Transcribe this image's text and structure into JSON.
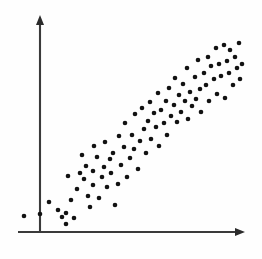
{
  "figure": {
    "title": "",
    "caption": "",
    "background_color": "#fefefe",
    "width": 262,
    "height": 259
  },
  "axes": {
    "x_axis_name": "horizontal-axis",
    "y_axis_name": "vertical-axis",
    "axis_color": "#3a3a3a",
    "arrow_color": "#2b2b2b",
    "origin_x": 40,
    "origin_y": 232,
    "x_axis_start_x": 18,
    "x_axis_end_x": 243,
    "y_axis_top_y": 18,
    "has_arrowheads": true,
    "has_tick_labels": false,
    "has_gridlines": false,
    "x_label": "",
    "y_label": ""
  },
  "marker": {
    "name": "data-point",
    "color": "#121212",
    "radius": 2.3,
    "shape": "circle"
  },
  "chart_data": {
    "type": "scatter",
    "title": "",
    "subtitle": "",
    "xlabel": "",
    "ylabel": "",
    "xlim": [
      0,
      100
    ],
    "ylim": [
      0,
      100
    ],
    "grid": false,
    "legend": null,
    "legend_position": "none",
    "annotations": [],
    "axis_style": "arrowed-axes-no-ticks",
    "correlation": "strong positive linear",
    "n_points": 95,
    "series": [
      {
        "name": "observations",
        "color": "#121212",
        "points": [
          [
            -7.8,
            7.5
          ],
          [
            0.0,
            8.4
          ],
          [
            5.3,
            14.2
          ],
          [
            9.7,
            10.0
          ],
          [
            11.5,
            6.8
          ],
          [
            13.3,
            3.2
          ],
          [
            13.7,
            12.0
          ],
          [
            14.6,
            29.8
          ],
          [
            15.9,
            17.3
          ],
          [
            17.2,
            8.0
          ],
          [
            18.6,
            22.5
          ],
          [
            19.9,
            30.6
          ],
          [
            20.8,
            39.6
          ],
          [
            22.1,
            27.8
          ],
          [
            23.0,
            34.0
          ],
          [
            23.9,
            19.0
          ],
          [
            24.8,
            13.5
          ],
          [
            26.1,
            31.0
          ],
          [
            26.5,
            24.0
          ],
          [
            27.0,
            43.5
          ],
          [
            28.3,
            38.0
          ],
          [
            29.2,
            18.2
          ],
          [
            30.5,
            28.5
          ],
          [
            31.9,
            33.5
          ],
          [
            32.3,
            46.0
          ],
          [
            33.2,
            23.6
          ],
          [
            34.5,
            37.2
          ],
          [
            35.4,
            30.2
          ],
          [
            36.3,
            40.5
          ],
          [
            37.2,
            15.0
          ],
          [
            38.5,
            25.5
          ],
          [
            39.4,
            49.5
          ],
          [
            40.3,
            35.0
          ],
          [
            41.6,
            44.0
          ],
          [
            42.0,
            56.0
          ],
          [
            43.4,
            29.0
          ],
          [
            44.7,
            38.5
          ],
          [
            45.6,
            50.0
          ],
          [
            46.5,
            43.0
          ],
          [
            47.4,
            59.5
          ],
          [
            48.7,
            33.8
          ],
          [
            49.6,
            47.0
          ],
          [
            50.4,
            63.5
          ],
          [
            51.8,
            53.0
          ],
          [
            52.7,
            41.5
          ],
          [
            53.6,
            57.5
          ],
          [
            54.5,
            67.0
          ],
          [
            55.3,
            48.5
          ],
          [
            56.7,
            61.0
          ],
          [
            57.6,
            54.0
          ],
          [
            58.5,
            71.0
          ],
          [
            59.4,
            45.0
          ],
          [
            60.2,
            63.0
          ],
          [
            61.6,
            56.5
          ],
          [
            62.5,
            68.0
          ],
          [
            63.4,
            50.5
          ],
          [
            64.3,
            74.5
          ],
          [
            65.1,
            60.5
          ],
          [
            66.5,
            66.0
          ],
          [
            67.4,
            79.5
          ],
          [
            68.3,
            57.0
          ],
          [
            69.2,
            70.5
          ],
          [
            70.0,
            62.0
          ],
          [
            71.4,
            76.0
          ],
          [
            72.3,
            67.5
          ],
          [
            73.2,
            84.0
          ],
          [
            74.1,
            58.5
          ],
          [
            75.0,
            72.5
          ],
          [
            75.8,
            65.5
          ],
          [
            77.2,
            80.0
          ],
          [
            78.1,
            69.0
          ],
          [
            79.0,
            88.5
          ],
          [
            79.9,
            74.0
          ],
          [
            80.7,
            62.5
          ],
          [
            82.1,
            83.0
          ],
          [
            83.0,
            77.0
          ],
          [
            83.9,
            91.5
          ],
          [
            84.8,
            68.5
          ],
          [
            85.6,
            86.0
          ],
          [
            87.0,
            79.5
          ],
          [
            87.9,
            95.0
          ],
          [
            88.8,
            73.0
          ],
          [
            89.7,
            88.0
          ],
          [
            90.5,
            82.0
          ],
          [
            91.9,
            97.5
          ],
          [
            92.8,
            70.0
          ],
          [
            93.7,
            90.5
          ],
          [
            94.6,
            84.5
          ],
          [
            95.4,
            96.0
          ],
          [
            96.8,
            78.0
          ],
          [
            97.7,
            92.0
          ],
          [
            98.6,
            86.5
          ],
          [
            99.5,
            99.0
          ],
          [
            100.3,
            81.0
          ],
          [
            101.2,
            88.5
          ]
        ],
        "pixel_points": [
          [
            24,
            216
          ],
          [
            40,
            214
          ],
          [
            49,
            202
          ],
          [
            58,
            210
          ],
          [
            62,
            217
          ],
          [
            66,
            224
          ],
          [
            66,
            213
          ],
          [
            68,
            176
          ],
          [
            71,
            200
          ],
          [
            74,
            218
          ],
          [
            77,
            189
          ],
          [
            80,
            173
          ],
          [
            82,
            155
          ],
          [
            84,
            179
          ],
          [
            86,
            166
          ],
          [
            88,
            196
          ],
          [
            90,
            207
          ],
          [
            93,
            171
          ],
          [
            93,
            185
          ],
          [
            94,
            146
          ],
          [
            97,
            157
          ],
          [
            99,
            198
          ],
          [
            102,
            177
          ],
          [
            104,
            167
          ],
          [
            105,
            142
          ],
          [
            107,
            187
          ],
          [
            110,
            159
          ],
          [
            111,
            173
          ],
          [
            113,
            153
          ],
          [
            115,
            205
          ],
          [
            118,
            184
          ],
          [
            119,
            136
          ],
          [
            121,
            165
          ],
          [
            124,
            147
          ],
          [
            125,
            123
          ],
          [
            127,
            177
          ],
          [
            130,
            158
          ],
          [
            132,
            135
          ],
          [
            134,
            149
          ],
          [
            135,
            114
          ],
          [
            138,
            169
          ],
          [
            140,
            141
          ],
          [
            142,
            108
          ],
          [
            144,
            129
          ],
          [
            146,
            153
          ],
          [
            148,
            121
          ],
          [
            150,
            102
          ],
          [
            151,
            139
          ],
          [
            154,
            113
          ],
          [
            156,
            127
          ],
          [
            158,
            93
          ],
          [
            159,
            146
          ],
          [
            161,
            110
          ],
          [
            164,
            123
          ],
          [
            166,
            101
          ],
          [
            167,
            135
          ],
          [
            169,
            88
          ],
          [
            171,
            116
          ],
          [
            174,
            105
          ],
          [
            175,
            78
          ],
          [
            177,
            122
          ],
          [
            179,
            95
          ],
          [
            181,
            112
          ],
          [
            183,
            84
          ],
          [
            185,
            101
          ],
          [
            187,
            68
          ],
          [
            188,
            119
          ],
          [
            190,
            92
          ],
          [
            192,
            106
          ],
          [
            195,
            77
          ],
          [
            196,
            99
          ],
          [
            198,
            60
          ],
          [
            200,
            89
          ],
          [
            201,
            112
          ],
          [
            204,
            73
          ],
          [
            206,
            85
          ],
          [
            208,
            57
          ],
          [
            209,
            101
          ],
          [
            211,
            66
          ],
          [
            214,
            79
          ],
          [
            216,
            48
          ],
          [
            217,
            94
          ],
          [
            219,
            64
          ],
          [
            221,
            76
          ],
          [
            224,
            45
          ],
          [
            225,
            98
          ],
          [
            227,
            61
          ],
          [
            229,
            73
          ],
          [
            230,
            50
          ],
          [
            233,
            85
          ],
          [
            235,
            57
          ],
          [
            237,
            68
          ],
          [
            239,
            43
          ],
          [
            240,
            79
          ],
          [
            242,
            64
          ]
        ]
      }
    ]
  }
}
